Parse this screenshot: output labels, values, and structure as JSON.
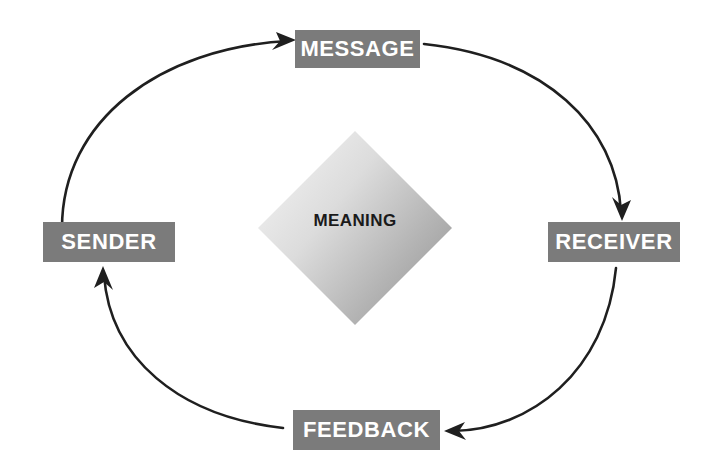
{
  "diagram": {
    "background_color": "#ffffff",
    "node_fill_color": "#7b7b7b",
    "node_text_color": "#ffffff",
    "arrow_color": "#1a1a1a",
    "center": {
      "label": "MEANING",
      "shape": "diamond",
      "text_color": "#1a1a1a",
      "gradient_from": "#f2f2f2",
      "gradient_to": "#9a9a9a"
    },
    "nodes": [
      {
        "id": "sender",
        "label": "SENDER",
        "position": "left"
      },
      {
        "id": "message",
        "label": "MESSAGE",
        "position": "top"
      },
      {
        "id": "receiver",
        "label": "RECEIVER",
        "position": "right"
      },
      {
        "id": "feedback",
        "label": "FEEDBACK",
        "position": "bottom"
      }
    ],
    "arrows": [
      {
        "id": "sender-to-message",
        "from": "SENDER",
        "to": "MESSAGE",
        "direction": "clockwise"
      },
      {
        "id": "message-to-receiver",
        "from": "MESSAGE",
        "to": "RECEIVER",
        "direction": "clockwise"
      },
      {
        "id": "receiver-to-feedback",
        "from": "RECEIVER",
        "to": "FEEDBACK",
        "direction": "clockwise"
      },
      {
        "id": "feedback-to-sender",
        "from": "FEEDBACK",
        "to": "SENDER",
        "direction": "clockwise"
      }
    ]
  }
}
